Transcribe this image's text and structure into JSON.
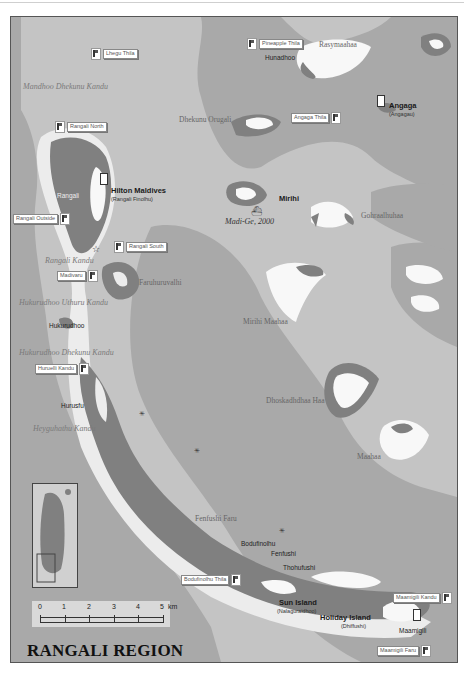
{
  "map": {
    "title": "RANGALI REGION",
    "colors": {
      "deep_water": "#a9a9a9",
      "lagoon": "#c4c4c4",
      "reef": "#ececec",
      "island": "#f8f8f8",
      "land": "#808080"
    },
    "channel_labels": [
      {
        "text": "Mandhoo Dhekunu Kandu",
        "x": 12,
        "y": 66
      },
      {
        "text": "Rangali Kandu",
        "x": 34,
        "y": 240
      },
      {
        "text": "Hukurudhoo Uthuru Kandu",
        "x": 8,
        "y": 282
      },
      {
        "text": "Hukurudhoo Dhekunu Kandu",
        "x": 8,
        "y": 332
      },
      {
        "text": "Heyguhathu Kandu",
        "x": 22,
        "y": 408
      },
      {
        "text": "Madi-Ge, 2000",
        "x": 224,
        "y": 200
      }
    ],
    "reef_labels": [
      {
        "text": "Rasymaahaa",
        "x": 308,
        "y": 24
      },
      {
        "text": "Dhekunu Orugali",
        "x": 178,
        "y": 99
      },
      {
        "text": "Gohraalhuhaa",
        "x": 350,
        "y": 195
      },
      {
        "text": "Faruhuruvalhi",
        "x": 128,
        "y": 262
      },
      {
        "text": "Mirihi Maahaa",
        "x": 232,
        "y": 301
      },
      {
        "text": "Dhoskadhdhaa Haa",
        "x": 255,
        "y": 380
      },
      {
        "text": "Maahaa",
        "x": 346,
        "y": 436
      },
      {
        "text": "Fenfushi Faru",
        "x": 184,
        "y": 498
      }
    ],
    "islands": [
      {
        "name": "Hunadhoo",
        "x": 262,
        "y": 40,
        "bold": false
      },
      {
        "name": "Rangali",
        "x": 50,
        "y": 178,
        "bold": false
      },
      {
        "name": "Hukurudhoo",
        "x": 40,
        "y": 308,
        "bold": false
      },
      {
        "name": "Hurusfu",
        "x": 56,
        "y": 388,
        "bold": false
      },
      {
        "name": "Bodufinolhu",
        "x": 240,
        "y": 526,
        "bold": false
      },
      {
        "name": "Fenfushi",
        "x": 268,
        "y": 535,
        "bold": false
      },
      {
        "name": "Thohufushi",
        "x": 280,
        "y": 549,
        "bold": false
      },
      {
        "name": "Maamigili",
        "x": 398,
        "y": 613,
        "bold": false
      }
    ],
    "resorts": [
      {
        "name": "Hilton Maldives",
        "sub": "(Rangali Finolhu)",
        "x": 111,
        "y": 173
      },
      {
        "name": "Angaga",
        "sub": "(Angagau)",
        "x": 387,
        "y": 89
      },
      {
        "name": "Mirihi",
        "sub": "",
        "x": 277,
        "y": 180
      },
      {
        "name": "Sun Island",
        "sub": "(Nalaguraidhoo)",
        "x": 278,
        "y": 584
      },
      {
        "name": "Holiday Island",
        "sub": "(Dhiffushi)",
        "x": 319,
        "y": 599
      }
    ],
    "dive_sites": [
      {
        "name": "Lhegu Thila",
        "x": 98,
        "y": 47,
        "flag_left": true
      },
      {
        "name": "Pineapple Thila",
        "x": 248,
        "y": 37,
        "flag_left": true
      },
      {
        "name": "Rangali North",
        "x": 62,
        "y": 121,
        "flag_left": true
      },
      {
        "name": "Angaga Thila",
        "x": 304,
        "y": 111,
        "flag_left": false
      },
      {
        "name": "Rangali Outside",
        "x": 9,
        "y": 211,
        "flag_left": false
      },
      {
        "name": "Rangali South",
        "x": 113,
        "y": 240,
        "flag_left": true
      },
      {
        "name": "Madivaru",
        "x": 57,
        "y": 269,
        "flag_left": false
      },
      {
        "name": "Huruelli Kandu",
        "x": 34,
        "y": 362,
        "flag_left": false
      },
      {
        "name": "Bodufinolhu Thila",
        "x": 178,
        "y": 566,
        "flag_left": false
      },
      {
        "name": "Maamigili Kandu",
        "x": 393,
        "y": 583,
        "flag_left": false
      },
      {
        "name": "Maamigili Faru",
        "x": 376,
        "y": 637,
        "flag_left": false
      }
    ],
    "scale": {
      "ticks": [
        "0",
        "1",
        "2",
        "3",
        "4",
        "5"
      ],
      "unit": "km"
    }
  }
}
